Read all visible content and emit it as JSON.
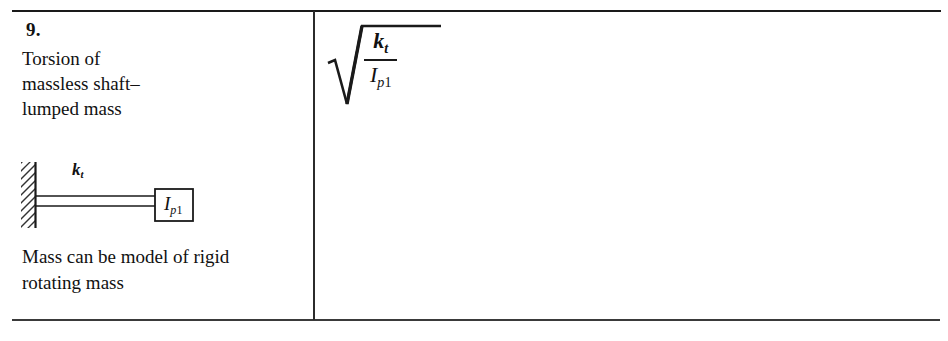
{
  "table": {
    "item_number": "9.",
    "description_lines": [
      "Torsion of",
      "massless shaft–",
      "lumped mass"
    ],
    "note_lines": [
      "Mass can be model of rigid",
      "rotating mass"
    ],
    "rule_color": "#1a1a1a",
    "divider_color": "#2b2b2b"
  },
  "diagram": {
    "name": "torsional-shaft-with-lumped-disk",
    "wall_label": "fixed-support-hatching",
    "stiffness_symbol": "k",
    "stiffness_subscript": "t",
    "mass_symbol": "I",
    "mass_subscript_italic": "p",
    "mass_subscript_plain": "1",
    "line_color": "#1a1a1a"
  },
  "formula": {
    "expression": "sqrt(k_t / I_p1)",
    "numerator_symbol": "k",
    "numerator_subscript": "t",
    "denominator_symbol": "I",
    "denominator_subscript_italic": "p",
    "denominator_subscript_plain": "1",
    "radical_glyph": "√"
  }
}
